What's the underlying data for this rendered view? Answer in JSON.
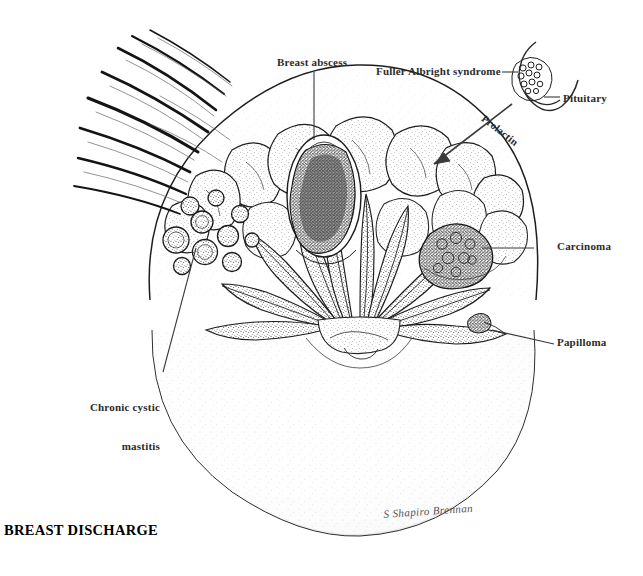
{
  "figure": {
    "title": "BREAST DISCHARGE",
    "signature": "S Shapiro Brennan"
  },
  "labels": {
    "breast_abscess": "Breast abscess",
    "fuller_albright_syndrome": "Fuller Albright syndrome",
    "pituitary": "Pituitary",
    "prolactin": "Prolactin",
    "carcinoma": "Carcinoma",
    "papilloma": "Papilloma",
    "chronic_cystic_mastitis_line1": "Chronic cystic",
    "chronic_cystic_mastitis_line2": "mastitis"
  },
  "colors": {
    "ink": "#1a1a1a",
    "label_text": "#2b2b2b",
    "leader_line": "#3a3a3a",
    "stipple": "#404040",
    "paper": "#ffffff"
  }
}
